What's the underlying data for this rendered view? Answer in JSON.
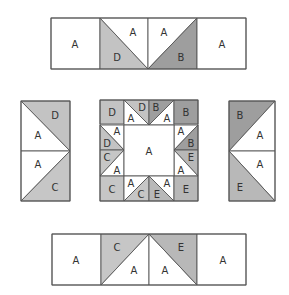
{
  "colors": {
    "A": "#ffffff",
    "B": "#9e9e9e",
    "C": "#c6c6c6",
    "D": "#c3c3c3",
    "E": "#b8b8b8",
    "stroke": "#555555",
    "label": "#333333"
  },
  "units": {
    "top_row": {
      "label": "Top strip",
      "x": 51,
      "y": 18,
      "w": 195,
      "h": 51,
      "pieces": [
        {
          "points": [
            [
              0,
              0
            ],
            [
              49,
              0
            ],
            [
              49,
              51
            ],
            [
              0,
              51
            ]
          ],
          "patch": "A",
          "label": "A",
          "lx": 24,
          "ly": 26
        },
        {
          "points": [
            [
              49,
              0
            ],
            [
              97,
              51
            ],
            [
              49,
              51
            ]
          ],
          "patch": "D",
          "label": "D",
          "lx": 66,
          "ly": 39
        },
        {
          "points": [
            [
              49,
              0
            ],
            [
              97,
              0
            ],
            [
              97,
              51
            ]
          ],
          "patch": "A",
          "label": "A",
          "lx": 82,
          "ly": 14
        },
        {
          "points": [
            [
              97,
              0
            ],
            [
              146,
              0
            ],
            [
              97,
              51
            ]
          ],
          "patch": "A",
          "label": "A",
          "lx": 113,
          "ly": 14
        },
        {
          "points": [
            [
              146,
              0
            ],
            [
              146,
              51
            ],
            [
              97,
              51
            ]
          ],
          "patch": "B",
          "label": "B",
          "lx": 130,
          "ly": 39
        },
        {
          "points": [
            [
              146,
              0
            ],
            [
              195,
              0
            ],
            [
              195,
              51
            ],
            [
              146,
              51
            ]
          ],
          "patch": "A",
          "label": "A",
          "lx": 171,
          "ly": 26
        }
      ]
    },
    "left_col": {
      "label": "Left strip",
      "x": 21,
      "y": 101,
      "w": 49,
      "h": 100,
      "pieces": [
        {
          "points": [
            [
              0,
              0
            ],
            [
              49,
              0
            ],
            [
              49,
              50
            ]
          ],
          "patch": "D",
          "label": "D",
          "lx": 34,
          "ly": 14
        },
        {
          "points": [
            [
              0,
              0
            ],
            [
              49,
              50
            ],
            [
              0,
              50
            ]
          ],
          "patch": "A",
          "label": "A",
          "lx": 17,
          "ly": 34
        },
        {
          "points": [
            [
              0,
              50
            ],
            [
              49,
              50
            ],
            [
              0,
              100
            ]
          ],
          "patch": "A",
          "label": "A",
          "lx": 17,
          "ly": 63
        },
        {
          "points": [
            [
              49,
              50
            ],
            [
              49,
              100
            ],
            [
              0,
              100
            ]
          ],
          "patch": "C",
          "label": "C",
          "lx": 34,
          "ly": 86
        }
      ]
    },
    "right_col": {
      "label": "Right strip",
      "x": 229,
      "y": 101,
      "w": 46,
      "h": 100,
      "pieces": [
        {
          "points": [
            [
              0,
              0
            ],
            [
              46,
              0
            ],
            [
              0,
              50
            ]
          ],
          "patch": "B",
          "label": "B",
          "lx": 11,
          "ly": 14
        },
        {
          "points": [
            [
              46,
              0
            ],
            [
              46,
              50
            ],
            [
              0,
              50
            ]
          ],
          "patch": "A",
          "label": "A",
          "lx": 31,
          "ly": 34
        },
        {
          "points": [
            [
              0,
              50
            ],
            [
              46,
              50
            ],
            [
              46,
              100
            ]
          ],
          "patch": "A",
          "label": "A",
          "lx": 31,
          "ly": 63
        },
        {
          "points": [
            [
              0,
              50
            ],
            [
              46,
              100
            ],
            [
              0,
              100
            ]
          ],
          "patch": "E",
          "label": "E",
          "lx": 11,
          "ly": 86
        }
      ]
    },
    "bottom_row": {
      "label": "Bottom strip",
      "x": 52,
      "y": 234,
      "w": 194,
      "h": 51,
      "pieces": [
        {
          "points": [
            [
              0,
              0
            ],
            [
              49,
              0
            ],
            [
              49,
              51
            ],
            [
              0,
              51
            ]
          ],
          "patch": "A",
          "label": "A",
          "lx": 24,
          "ly": 26
        },
        {
          "points": [
            [
              49,
              0
            ],
            [
              97,
              0
            ],
            [
              49,
              51
            ]
          ],
          "patch": "C",
          "label": "C",
          "lx": 65,
          "ly": 13
        },
        {
          "points": [
            [
              97,
              0
            ],
            [
              97,
              51
            ],
            [
              49,
              51
            ]
          ],
          "patch": "A",
          "label": "A",
          "lx": 82,
          "ly": 36
        },
        {
          "points": [
            [
              97,
              0
            ],
            [
              145,
              51
            ],
            [
              97,
              51
            ]
          ],
          "patch": "A",
          "label": "A",
          "lx": 113,
          "ly": 36
        },
        {
          "points": [
            [
              97,
              0
            ],
            [
              145,
              0
            ],
            [
              145,
              51
            ]
          ],
          "patch": "E",
          "label": "E",
          "lx": 129,
          "ly": 13
        },
        {
          "points": [
            [
              145,
              0
            ],
            [
              194,
              0
            ],
            [
              194,
              51
            ],
            [
              145,
              51
            ]
          ],
          "patch": "A",
          "label": "A",
          "lx": 171,
          "ly": 26
        }
      ]
    },
    "center_block": {
      "label": "Center block",
      "x": 100,
      "y": 100,
      "w": 98,
      "h": 101,
      "pieces": [
        {
          "points": [
            [
              0,
              0
            ],
            [
              24,
              0
            ],
            [
              24,
              24
            ],
            [
              0,
              24
            ]
          ],
          "patch": "D",
          "label": "D",
          "lx": 12,
          "ly": 12
        },
        {
          "points": [
            [
              24,
              0
            ],
            [
              49,
              25
            ],
            [
              24,
              25
            ]
          ],
          "patch": "A",
          "label": "A",
          "lx": 31,
          "ly": 18
        },
        {
          "points": [
            [
              24,
              0
            ],
            [
              49,
              0
            ],
            [
              49,
              25
            ]
          ],
          "patch": "D",
          "label": "D",
          "lx": 42,
          "ly": 7
        },
        {
          "points": [
            [
              49,
              0
            ],
            [
              74,
              0
            ],
            [
              49,
              25
            ]
          ],
          "patch": "B",
          "label": "B",
          "lx": 56,
          "ly": 7
        },
        {
          "points": [
            [
              74,
              0
            ],
            [
              74,
              25
            ],
            [
              49,
              25
            ]
          ],
          "patch": "A",
          "label": "A",
          "lx": 67,
          "ly": 18
        },
        {
          "points": [
            [
              74,
              0
            ],
            [
              98,
              0
            ],
            [
              98,
              24
            ],
            [
              74,
              24
            ]
          ],
          "patch": "B",
          "label": "B",
          "lx": 86,
          "ly": 12
        },
        {
          "points": [
            [
              0,
              25
            ],
            [
              24,
              25
            ],
            [
              24,
              50
            ]
          ],
          "patch": "A",
          "label": "A",
          "lx": 17,
          "ly": 31
        },
        {
          "points": [
            [
              0,
              25
            ],
            [
              24,
              50
            ],
            [
              0,
              50
            ]
          ],
          "patch": "D",
          "label": "D",
          "lx": 7,
          "ly": 43
        },
        {
          "points": [
            [
              0,
              50
            ],
            [
              24,
              50
            ],
            [
              0,
              76
            ]
          ],
          "patch": "C",
          "label": "C",
          "lx": 7,
          "ly": 57
        },
        {
          "points": [
            [
              24,
              50
            ],
            [
              24,
              76
            ],
            [
              0,
              76
            ]
          ],
          "patch": "A",
          "label": "A",
          "lx": 17,
          "ly": 70
        },
        {
          "points": [
            [
              74,
              25
            ],
            [
              98,
              25
            ],
            [
              74,
              50
            ]
          ],
          "patch": "A",
          "label": "A",
          "lx": 81,
          "ly": 31
        },
        {
          "points": [
            [
              98,
              25
            ],
            [
              98,
              50
            ],
            [
              74,
              50
            ]
          ],
          "patch": "B",
          "label": "B",
          "lx": 91,
          "ly": 43
        },
        {
          "points": [
            [
              74,
              50
            ],
            [
              98,
              50
            ],
            [
              98,
              76
            ]
          ],
          "patch": "E",
          "label": "E",
          "lx": 91,
          "ly": 57
        },
        {
          "points": [
            [
              74,
              50
            ],
            [
              98,
              76
            ],
            [
              74,
              76
            ]
          ],
          "patch": "A",
          "label": "A",
          "lx": 81,
          "ly": 70
        },
        {
          "points": [
            [
              24,
              25
            ],
            [
              74,
              25
            ],
            [
              74,
              76
            ],
            [
              24,
              76
            ]
          ],
          "patch": "A",
          "label": "A",
          "lx": 49,
          "ly": 51
        },
        {
          "points": [
            [
              0,
              76
            ],
            [
              24,
              76
            ],
            [
              24,
              101
            ],
            [
              0,
              101
            ]
          ],
          "patch": "C",
          "label": "C",
          "lx": 12,
          "ly": 89
        },
        {
          "points": [
            [
              24,
              76
            ],
            [
              49,
              76
            ],
            [
              24,
              101
            ]
          ],
          "patch": "A",
          "label": "A",
          "lx": 31,
          "ly": 83
        },
        {
          "points": [
            [
              49,
              76
            ],
            [
              49,
              101
            ],
            [
              24,
              101
            ]
          ],
          "patch": "C",
          "label": "C",
          "lx": 41,
          "ly": 94
        },
        {
          "points": [
            [
              49,
              76
            ],
            [
              74,
              101
            ],
            [
              49,
              101
            ]
          ],
          "patch": "E",
          "label": "E",
          "lx": 57,
          "ly": 94
        },
        {
          "points": [
            [
              49,
              76
            ],
            [
              74,
              76
            ],
            [
              74,
              101
            ]
          ],
          "patch": "A",
          "label": "A",
          "lx": 67,
          "ly": 83
        },
        {
          "points": [
            [
              74,
              76
            ],
            [
              98,
              76
            ],
            [
              98,
              101
            ],
            [
              74,
              101
            ]
          ],
          "patch": "E",
          "label": "E",
          "lx": 86,
          "ly": 89
        }
      ]
    }
  }
}
